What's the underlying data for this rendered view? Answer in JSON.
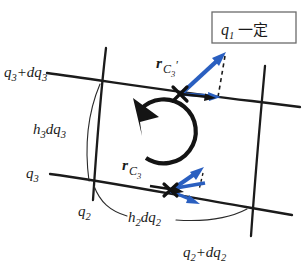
{
  "figure": {
    "background_color": "#ffffff",
    "vector_color": "#2a5fc0",
    "line_color": "#1b1b1b"
  },
  "boxed_note": {
    "symbol": "q",
    "subscript": "1",
    "text": "一定",
    "full": "q1 一定",
    "border_color": "#6b6b6b"
  },
  "labels": {
    "top_left": {
      "base": "q",
      "sub": "3",
      "suffix": "+dq",
      "suffix_sub": "3",
      "full": "q3+dq3"
    },
    "left_mid": {
      "base": "h",
      "sub": "3",
      "suffix": "dq",
      "suffix_sub": "3",
      "full": "h3dq3"
    },
    "left_low": {
      "base": "q",
      "sub": "3",
      "full": "q3"
    },
    "bottom_left": {
      "base": "q",
      "sub": "2",
      "full": "q2"
    },
    "bottom_mid": {
      "base": "h",
      "sub": "2",
      "suffix": "dq",
      "suffix_sub": "2",
      "full": "h2dq2"
    },
    "bottom_right": {
      "base": "q",
      "sub": "2",
      "suffix": "+dq",
      "suffix_sub": "2",
      "full": "q2+dq2"
    }
  },
  "vectors": {
    "upper": {
      "name": "r",
      "sub": "C",
      "subsub": "3",
      "prime": "′",
      "full": "r_C3'"
    },
    "lower": {
      "name": "r",
      "sub": "C",
      "subsub": "3",
      "prime": "",
      "full": "r_C3"
    }
  },
  "rotation": {
    "name": "counterclockwise-circulation",
    "direction": "counterclockwise"
  }
}
